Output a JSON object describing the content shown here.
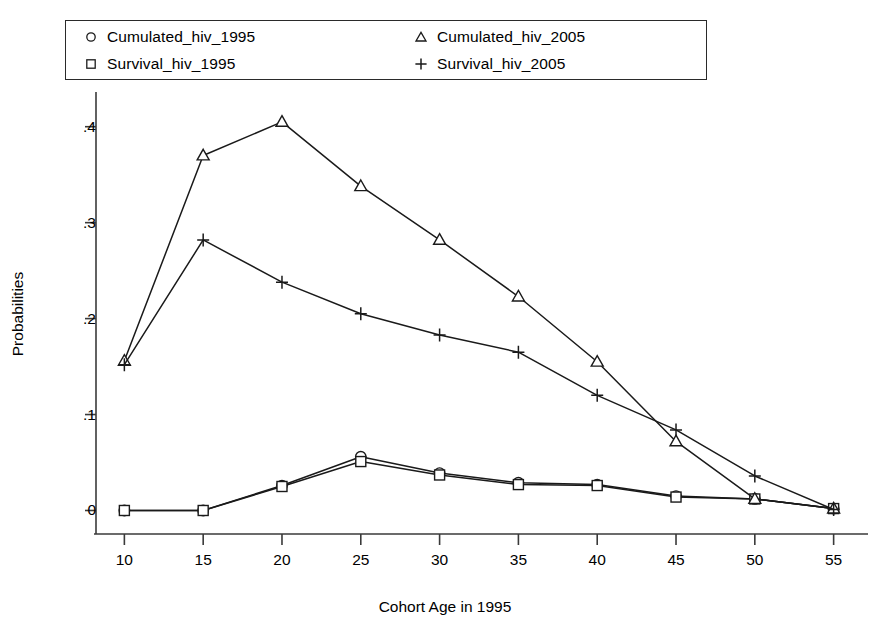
{
  "chart_data": {
    "type": "line",
    "title": "",
    "xlabel": "Cohort Age in 1995",
    "ylabel": "Probabilities",
    "x": [
      10,
      15,
      20,
      25,
      30,
      35,
      40,
      45,
      50,
      55
    ],
    "xticklabels": [
      "10",
      "15",
      "20",
      "25",
      "30",
      "35",
      "40",
      "45",
      "50",
      "55"
    ],
    "yticks": [
      0,
      0.1,
      0.2,
      0.3,
      0.4
    ],
    "yticklabels": [
      "0",
      ".1",
      ".2",
      ".3",
      ".4"
    ],
    "xlim": [
      8.2,
      56.8
    ],
    "ylim": [
      -0.012,
      0.432
    ],
    "grid": false,
    "legend_position": "top",
    "series": [
      {
        "name": "Cumulated_hiv_1995",
        "marker": "circle-marker",
        "values": [
          0.0,
          0.0,
          0.026,
          0.056,
          0.039,
          0.029,
          0.027,
          0.015,
          0.012,
          0.002
        ]
      },
      {
        "name": "Survival_hiv_1995",
        "marker": "square-marker",
        "values": [
          0.0,
          0.0,
          0.025,
          0.051,
          0.037,
          0.027,
          0.026,
          0.014,
          0.012,
          0.002
        ]
      },
      {
        "name": "Cumulated_hiv_2005",
        "marker": "triangle-marker",
        "values": [
          0.156,
          0.37,
          0.405,
          0.338,
          0.282,
          0.223,
          0.155,
          0.072,
          0.012,
          0.002
        ]
      },
      {
        "name": "Survival_hiv_2005",
        "marker": "plus-marker",
        "values": [
          0.152,
          0.282,
          0.238,
          0.205,
          0.183,
          0.165,
          0.12,
          0.084,
          0.036,
          0.001
        ]
      }
    ]
  },
  "legend": {
    "entries": [
      {
        "marker": "circle-marker",
        "label": "Cumulated_hiv_1995"
      },
      {
        "marker": "triangle-marker",
        "label": "Cumulated_hiv_2005"
      },
      {
        "marker": "square-marker",
        "label": "Survival_hiv_1995"
      },
      {
        "marker": "plus-marker",
        "label": "Survival_hiv_2005"
      }
    ]
  },
  "colors": {
    "line": "#1a1a1a",
    "axis": "#3a3a3a",
    "background": "#ffffff",
    "text": "#000000"
  }
}
